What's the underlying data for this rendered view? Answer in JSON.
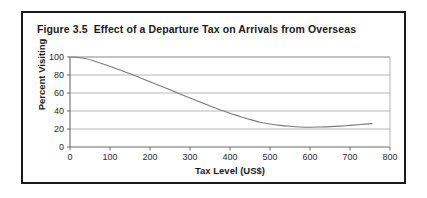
{
  "figure": {
    "title": "Figure 3.5  Effect of a Departure Tax on Arrivals from Overseas",
    "border_color": "#1a1a1a",
    "background": "#ffffff"
  },
  "chart_data": {
    "type": "line",
    "title": "Figure 3.5  Effect of a Departure Tax on Arrivals from Overseas",
    "xlabel": "Tax Level (US$)",
    "ylabel": "Percent Visiting",
    "xlim": [
      0,
      800
    ],
    "ylim": [
      0,
      100
    ],
    "xticks": [
      0,
      100,
      200,
      300,
      400,
      500,
      600,
      700,
      800
    ],
    "xtick_labels": [
      "0",
      "100",
      "200",
      "300",
      "400",
      "500",
      "600",
      "700",
      "800"
    ],
    "yticks": [
      0,
      20,
      40,
      60,
      80,
      100
    ],
    "ytick_labels": [
      "0",
      "20",
      "40",
      "60",
      "80",
      "100"
    ],
    "grid": "horizontal",
    "legend": "none",
    "line_color": "#7a7a7a",
    "grid_color": "#9a9a9a",
    "axis_color": "#6a6a6a",
    "series": [
      {
        "name": "Percent Visiting",
        "x": [
          0,
          20,
          40,
          60,
          80,
          100,
          125,
          150,
          175,
          200,
          225,
          250,
          275,
          300,
          325,
          350,
          375,
          400,
          425,
          450,
          475,
          500,
          525,
          550,
          575,
          600,
          625,
          650,
          675,
          700,
          725,
          755
        ],
        "values": [
          100,
          99.5,
          98,
          95.5,
          92.5,
          89.5,
          85.5,
          81.5,
          77,
          72.5,
          68,
          63.5,
          59,
          54.5,
          50,
          45.5,
          41.5,
          37.5,
          34,
          30.5,
          27.5,
          25.5,
          24,
          23,
          22.3,
          22,
          22.2,
          22.6,
          23.2,
          24,
          25,
          26
        ]
      }
    ]
  },
  "axis_titles": {
    "x": "Tax Level (US$)",
    "y": "Percent Visiting"
  }
}
